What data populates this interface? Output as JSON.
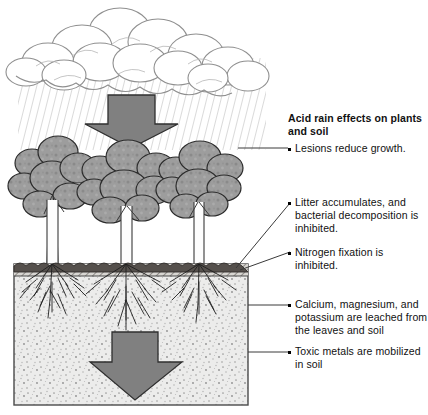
{
  "figure": {
    "title": "Acid rain effects on plants and soil",
    "scene_elements": [
      "storm-cloud",
      "rain-hatching",
      "downward-arrow-atmosphere",
      "tree-left",
      "tree-center",
      "tree-right",
      "litter-layer",
      "soil-block",
      "root-systems",
      "downward-arrow-soil"
    ]
  },
  "annotations": {
    "heading": "Acid rain effects on plants and soil",
    "items": [
      {
        "text": "Lesions reduce growth."
      },
      {
        "text": "Litter accumulates, and bacterial decomposition is inhibited."
      },
      {
        "text": "Nitrogen fixation is inhibited."
      },
      {
        "text": "Calcium, magnesium, and potassium are leached from the leaves and soil"
      },
      {
        "text": "Toxic metals are mobilized in soil"
      }
    ]
  },
  "colors": {
    "arrow_fill": "#808080",
    "arrow_stroke": "#303030",
    "foliage_fill": "#9a9a9a",
    "foliage_stroke": "#2b2b2b",
    "soil_fill": "#e8e8e6",
    "soil_stroke": "#4a4a4a",
    "litter_fill": "#55504c",
    "rain_stroke": "#b9b9b9",
    "cloud_stroke": "#9a9a9a",
    "leader_stroke": "#3a3a3a",
    "text": "#111111",
    "background": "#ffffff"
  }
}
